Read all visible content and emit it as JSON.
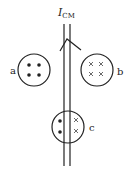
{
  "diagram": {
    "current_label": {
      "main": "I",
      "sub": "CM"
    },
    "colors": {
      "stroke": "#222222",
      "background": "#ffffff"
    },
    "wires": {
      "count": 2,
      "direction": "up"
    },
    "circles": [
      {
        "label": "a",
        "field": "out-of-page",
        "symbol": "dot",
        "marks": 4
      },
      {
        "label": "b",
        "field": "into-page",
        "symbol": "cross",
        "marks": 4
      },
      {
        "label": "c",
        "field": "mixed",
        "left": {
          "symbol": "dot",
          "marks": 2
        },
        "right": {
          "symbol": "cross",
          "marks": 2
        }
      }
    ]
  }
}
